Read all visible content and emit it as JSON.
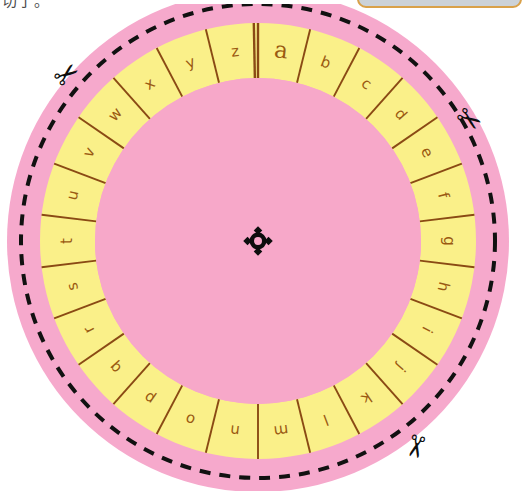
{
  "page": {
    "background_color": "#ffffff",
    "width": 515,
    "height": 491
  },
  "caption": {
    "text": "切了。",
    "color": "#4a4a4a"
  },
  "top_panel": {
    "label": "",
    "fill_color": "#ccd2d8",
    "border_color": "#d9a14a"
  },
  "wheel": {
    "title": "cipher-wheel",
    "center_x": 258,
    "center_y": 241,
    "outer_disc_radius": 251,
    "cut_line_radius": 237,
    "ring_outer_radius": 218,
    "ring_inner_radius": 163,
    "colors": {
      "outer_pink": "#f6a9cc",
      "inner_pink": "#f7a8c9",
      "ring_yellow": "#faf089",
      "divider_brown": "#8a4a14",
      "letter_brown": "#9a5a12",
      "cut_line_black": "#111111",
      "center_mark_black": "#0d0d0d"
    },
    "segment_count": 26,
    "letters": [
      "a",
      "b",
      "c",
      "d",
      "e",
      "f",
      "g",
      "h",
      "i",
      "j",
      "k",
      "l",
      "m",
      "n",
      "o",
      "p",
      "q",
      "r",
      "s",
      "t",
      "u",
      "v",
      "w",
      "x",
      "y",
      "z"
    ],
    "emphasized_letter": "a",
    "start_boundary_label": "z|a double divider at 12 o'clock",
    "direction": "clockwise",
    "center_mark": {
      "name": "registration-pivot-mark",
      "shape": "circle-with-four-points"
    }
  },
  "scissors": [
    {
      "id": "scissors-top-left",
      "x": 68,
      "y": 76,
      "rotation": -38,
      "glyph": "✂"
    },
    {
      "id": "scissors-right",
      "x": 468,
      "y": 121,
      "rotation": 36,
      "glyph": "✂"
    },
    {
      "id": "scissors-bottom-right",
      "x": 414,
      "y": 446,
      "rotation": 104,
      "glyph": "✂"
    }
  ]
}
